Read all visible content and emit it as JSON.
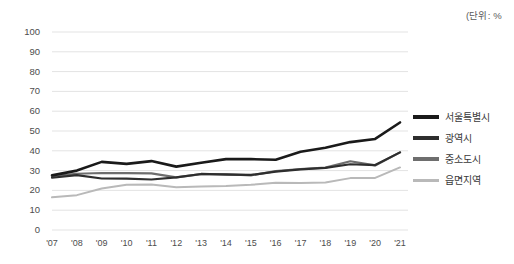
{
  "unit_note": "(단위: %",
  "legend": {
    "position": "right",
    "items": [
      {
        "label": "서울특별시",
        "color": "#1a1a1a",
        "width": 4.2
      },
      {
        "label": "광역시",
        "color": "#2e2e2e",
        "width": 3.4
      },
      {
        "label": "중소도시",
        "color": "#6e6e6e",
        "width": 3.2
      },
      {
        "label": "읍면지역",
        "color": "#b9b9b9",
        "width": 3.0
      }
    ]
  },
  "axis": {
    "y_ticks": [
      "100",
      "90",
      "80",
      "70",
      "60",
      "50",
      "40",
      "30",
      "20",
      "10",
      "0"
    ],
    "x_ticks": [
      "'07",
      "'08",
      "'09",
      "'10",
      "'11",
      "'12",
      "'13",
      "'14",
      "'15",
      "'16",
      "'17",
      "'18",
      "'19",
      "'20",
      "'21"
    ]
  },
  "colors": {
    "gridline": "#e3e3e3",
    "background": "#ffffff",
    "text": "#4d4d4d"
  },
  "chart_data": {
    "type": "line",
    "title": "",
    "subtitle": "",
    "xlabel": "",
    "ylabel": "",
    "unit": "%",
    "grid": true,
    "legend_position": "right",
    "ylim": [
      0,
      100
    ],
    "ytick_step": 10,
    "categories": [
      "'07",
      "'08",
      "'09",
      "'10",
      "'11",
      "'12",
      "'13",
      "'14",
      "'15",
      "'16",
      "'17",
      "'18",
      "'19",
      "'20",
      "'21"
    ],
    "series": [
      {
        "name": "서울특별시",
        "color": "#1a1a1a",
        "values": [
          27.6,
          30.0,
          34.4,
          33.4,
          34.8,
          32.0,
          34.0,
          35.8,
          35.8,
          35.5,
          39.5,
          41.5,
          44.4,
          46.0,
          54.3
        ]
      },
      {
        "name": "광역시",
        "color": "#2e2e2e",
        "values": [
          26.4,
          27.7,
          26.0,
          25.9,
          25.5,
          26.6,
          28.3,
          28.0,
          27.8,
          29.5,
          30.6,
          31.4,
          33.2,
          32.8,
          39.2
        ]
      },
      {
        "name": "중소도시",
        "color": "#6e6e6e",
        "values": [
          27.2,
          28.4,
          28.8,
          28.7,
          28.6,
          26.6,
          28.2,
          28.2,
          27.6,
          29.7,
          30.8,
          31.5,
          34.7,
          32.6,
          39.2
        ]
      },
      {
        "name": "읍면지역",
        "color": "#b9b9b9",
        "values": [
          16.5,
          17.6,
          21.0,
          22.8,
          23.0,
          21.6,
          22.0,
          22.2,
          22.8,
          23.9,
          23.8,
          24.0,
          26.2,
          26.3,
          31.6
        ]
      }
    ]
  }
}
